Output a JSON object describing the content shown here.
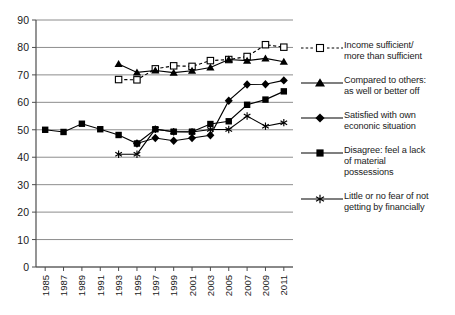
{
  "chart_data": {
    "type": "line",
    "title": "",
    "xlabel": "",
    "ylabel": "",
    "xlim": [
      1984,
      2012
    ],
    "ylim": [
      0,
      90
    ],
    "ytick_step": 10,
    "yticks": [
      0,
      10,
      20,
      30,
      40,
      50,
      60,
      70,
      80,
      90
    ],
    "xticks": [
      1985,
      1987,
      1989,
      1991,
      1993,
      1995,
      1997,
      1999,
      2001,
      2003,
      2005,
      2007,
      2009,
      2011
    ],
    "xtick_labels": [
      "1985",
      "1987",
      "1989",
      "1991",
      "1993",
      "1995",
      "1997",
      "1999",
      "2001",
      "2003",
      "2005",
      "2007",
      "2009",
      "2011"
    ],
    "grid": true,
    "grid_axis": "y",
    "legend_position": "right",
    "series": [
      {
        "name": "Income sufficient/ more than sufficient",
        "marker": "open-square",
        "linestyle": "dashed",
        "color": "#000000",
        "x": [
          1993,
          1995,
          1997,
          1999,
          2001,
          2003,
          2005,
          2007,
          2009,
          2011
        ],
        "values": [
          68.3,
          68.2,
          72.2,
          73.3,
          73.1,
          75.2,
          75.6,
          76.7,
          81.0,
          80.1
        ]
      },
      {
        "name": "Compared to others: as well or better off",
        "marker": "filled-triangle",
        "linestyle": "solid",
        "color": "#000000",
        "x": [
          1993,
          1995,
          1997,
          1999,
          2001,
          2003,
          2005,
          2007,
          2009,
          2011
        ],
        "values": [
          74.0,
          70.9,
          71.6,
          70.8,
          71.5,
          72.7,
          75.6,
          75.2,
          76.0,
          74.8
        ]
      },
      {
        "name": "Satisfied with own econonic situation",
        "marker": "filled-diamond",
        "linestyle": "solid",
        "color": "#000000",
        "x": [
          1995,
          1997,
          1999,
          2001,
          2003,
          2005,
          2007,
          2009,
          2011
        ],
        "values": [
          45.0,
          47.0,
          46.0,
          47.0,
          48.0,
          60.6,
          66.5,
          66.6,
          68.0
        ]
      },
      {
        "name": "Disagree: feel a lack of material possessions",
        "marker": "filled-square",
        "linestyle": "solid",
        "color": "#000000",
        "x": [
          1985,
          1987,
          1989,
          1991,
          1993,
          1995,
          1997,
          1999,
          2001,
          2003,
          2005,
          2007,
          2009,
          2011
        ],
        "values": [
          50.0,
          49.2,
          52.2,
          50.2,
          48.1,
          45.0,
          50.2,
          49.3,
          49.3,
          52.1,
          53.1,
          59.1,
          61.0,
          64.0
        ]
      },
      {
        "name": "Little or no fear of not getting by financially",
        "marker": "star",
        "linestyle": "solid",
        "color": "#000000",
        "x": [
          1993,
          1995,
          1997,
          1999,
          2001,
          2003,
          2005,
          2007,
          2009,
          2011
        ],
        "values": [
          41.1,
          41.1,
          50.2,
          49.3,
          49.2,
          50.1,
          50.1,
          55.0,
          51.3,
          52.6
        ]
      }
    ]
  },
  "legend": {
    "items": [
      {
        "label_line1": "Income sufficient/",
        "label_line2": "more than sufficient",
        "marker": "open-square",
        "style": "dashed"
      },
      {
        "label_line1": "Compared to others:",
        "label_line2": "as well or better off",
        "marker": "filled-triangle",
        "style": "solid"
      },
      {
        "label_line1": "Satisfied with own",
        "label_line2": "econonic situation",
        "marker": "filled-diamond",
        "style": "solid"
      },
      {
        "label_line1": "Disagree: feel a lack",
        "label_line2": "of material",
        "label_line3": "possessions",
        "marker": "filled-square",
        "style": "solid"
      },
      {
        "label_line1": "Little or no fear of not",
        "label_line2": "getting by financially",
        "marker": "star",
        "style": "solid"
      }
    ]
  },
  "colors": {
    "line": "#000000",
    "grid": "#808080",
    "axis": "#4d4d4d",
    "text": "#1a1a1a",
    "background": "#ffffff"
  }
}
